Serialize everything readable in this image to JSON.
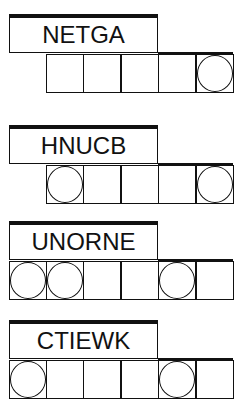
{
  "puzzles": [
    {
      "word": "NETGA",
      "cell_count": 5,
      "circled": [
        false,
        false,
        false,
        false,
        true
      ]
    },
    {
      "word": "HNUCB",
      "cell_count": 5,
      "circled": [
        true,
        false,
        false,
        false,
        true
      ]
    },
    {
      "word": "UNORNE",
      "cell_count": 6,
      "circled": [
        true,
        true,
        false,
        false,
        true,
        false
      ]
    },
    {
      "word": "CTIEWK",
      "cell_count": 6,
      "circled": [
        true,
        false,
        false,
        false,
        true,
        false
      ]
    }
  ]
}
